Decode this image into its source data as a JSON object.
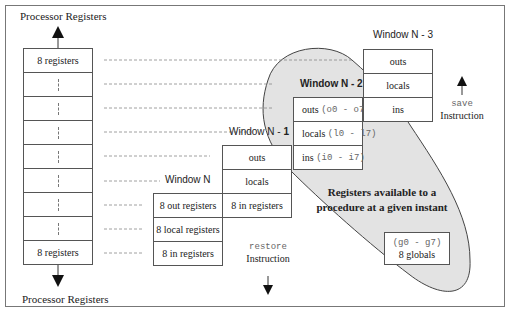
{
  "top_label": "Processor Registers",
  "bottom_label": "Processor Registers",
  "left_column": {
    "rows": [
      "8 registers",
      "",
      "",
      "",
      "",
      "",
      "",
      "",
      "8 registers"
    ]
  },
  "windows": {
    "n": {
      "title": "Window N",
      "rows": [
        "8 out registers",
        "8 local registers",
        "8 in registers"
      ]
    },
    "n1": {
      "title_a": "Window N - ",
      "title_b": "1",
      "rows": [
        "outs",
        "locals",
        "8 in registers"
      ]
    },
    "n2": {
      "title": "Window N - 2",
      "rows": [
        {
          "name": "outs",
          "range": "(o0 - o7)"
        },
        {
          "name": "locals",
          "range": "(l0 - l7)"
        },
        {
          "name": "ins",
          "range": "(i0 - i7)"
        }
      ]
    },
    "n3": {
      "title": "Window N - 3",
      "rows": [
        "outs",
        "locals",
        "ins"
      ]
    }
  },
  "available_label": {
    "line1": "Registers available to a",
    "line2": "procedure at a given instant"
  },
  "globals": {
    "range": "(g0 - g7)",
    "label": "8 globals"
  },
  "save": {
    "mnemonic": "save",
    "label": "Instruction"
  },
  "restore": {
    "mnemonic": "restore",
    "label": "Instruction"
  },
  "colors": {
    "ellipse_fill": "#e3e3e3",
    "ellipse_stroke": "#444444",
    "border": "#555555",
    "dash": "#888888"
  }
}
